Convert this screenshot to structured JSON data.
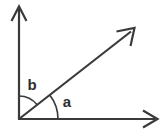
{
  "figure": {
    "type": "geometry-angle-diagram",
    "width": 162,
    "height": 134,
    "background_color": "#ffffff",
    "stroke_color": "#3a3a3a",
    "label_color": "#2e2e2e"
  },
  "labels": {
    "angle_a": "a",
    "angle_b": "b"
  },
  "geometry": {
    "vertex": {
      "x": 19,
      "y": 119
    },
    "vertical_axis": {
      "from_x": 19,
      "from_y": 119,
      "to_x": 19,
      "to_y": 8
    },
    "horizontal_axis": {
      "from_x": 19,
      "from_y": 119,
      "to_x": 155,
      "to_y": 119
    },
    "diagonal_ray": {
      "from_x": 19,
      "from_y": 119,
      "to_x": 133,
      "to_y": 30
    },
    "diagonal_angle_degrees": 38,
    "arc_a": {
      "radius": 39,
      "start_degrees": 0,
      "end_degrees": 38
    },
    "arc_b": {
      "radius": 23,
      "start_degrees": 38,
      "end_degrees": 90
    },
    "label_a_position": {
      "x": 67,
      "y": 103
    },
    "label_b_position": {
      "x": 32,
      "y": 86
    }
  }
}
